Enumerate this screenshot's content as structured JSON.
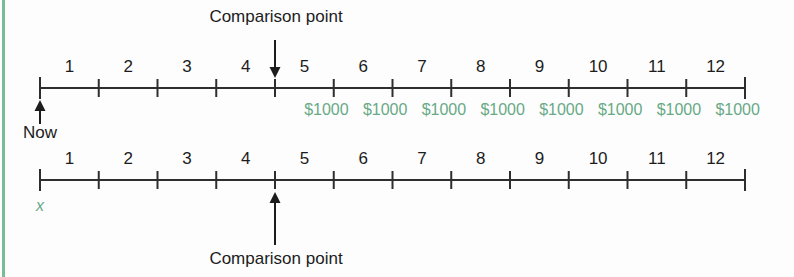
{
  "figure": {
    "background_color": "#fdfdfd",
    "accent_green": "#68a986",
    "rule_green": "#79bd97",
    "line_color": "#2e2e2e"
  },
  "chart_data": {
    "type": "timeline",
    "title": "",
    "xlabel": "",
    "ylabel": "",
    "grid": false,
    "legend": "none",
    "axis_range": [
      0,
      12
    ],
    "timelines": [
      {
        "name": "top-timeline",
        "tick_values": [
          0,
          1,
          2,
          3,
          4,
          5,
          6,
          7,
          8,
          9,
          10,
          11,
          12
        ],
        "period_labels": [
          "1",
          "2",
          "3",
          "4",
          "5",
          "6",
          "7",
          "8",
          "9",
          "10",
          "11",
          "12"
        ],
        "annotations": [
          {
            "name": "now",
            "text": "Now",
            "at_tick": 0,
            "arrow": "up",
            "position": "below"
          },
          {
            "name": "comparison-point",
            "text": "Comparison point",
            "at_tick": 4,
            "arrow": "down",
            "position": "above"
          }
        ],
        "cash_flows": [
          {
            "at_tick": 5,
            "amount": "$1000"
          },
          {
            "at_tick": 6,
            "amount": "$1000"
          },
          {
            "at_tick": 7,
            "amount": "$1000"
          },
          {
            "at_tick": 8,
            "amount": "$1000"
          },
          {
            "at_tick": 9,
            "amount": "$1000"
          },
          {
            "at_tick": 10,
            "amount": "$1000"
          },
          {
            "at_tick": 11,
            "amount": "$1000"
          },
          {
            "at_tick": 12,
            "amount": "$1000"
          }
        ]
      },
      {
        "name": "bottom-timeline",
        "tick_values": [
          0,
          1,
          2,
          3,
          4,
          5,
          6,
          7,
          8,
          9,
          10,
          11,
          12
        ],
        "period_labels": [
          "1",
          "2",
          "3",
          "4",
          "5",
          "6",
          "7",
          "8",
          "9",
          "10",
          "11",
          "12"
        ],
        "annotations": [
          {
            "name": "unknown-value",
            "text": "x",
            "at_tick": 0,
            "arrow": "none",
            "position": "below"
          },
          {
            "name": "comparison-point",
            "text": "Comparison point",
            "at_tick": 4,
            "arrow": "up",
            "position": "below"
          }
        ],
        "cash_flows": []
      }
    ]
  },
  "labels": {
    "comparison_point_top": "Comparison point",
    "comparison_point_bottom": "Comparison point",
    "now": "Now",
    "unknown_x": "x",
    "cash_amount": "$1000"
  }
}
